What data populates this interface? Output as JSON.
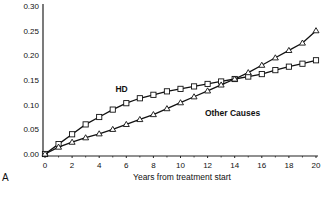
{
  "chart_data": {
    "type": "line",
    "title": "",
    "panel_label": "A",
    "xlabel": "Years from treatment start",
    "ylabel": "",
    "xlim": [
      0,
      20
    ],
    "ylim": [
      0,
      0.3
    ],
    "x_ticks": [
      "0",
      "2",
      "4",
      "6",
      "8",
      "10",
      "12",
      "14",
      "16",
      "18",
      "20"
    ],
    "y_ticks": [
      "0.00",
      "0.05",
      "0.10",
      "0.15",
      "0.20",
      "0.25",
      "0.30"
    ],
    "grid": false,
    "legend": "inline annotations",
    "x": [
      0,
      1,
      2,
      3,
      4,
      5,
      6,
      7,
      8,
      9,
      10,
      11,
      12,
      13,
      14,
      15,
      16,
      17,
      18,
      19,
      20
    ],
    "series": [
      {
        "name": "HD",
        "marker": "square",
        "values": [
          0.0,
          0.02,
          0.04,
          0.06,
          0.075,
          0.09,
          0.103,
          0.113,
          0.12,
          0.127,
          0.132,
          0.137,
          0.142,
          0.147,
          0.152,
          0.157,
          0.162,
          0.17,
          0.177,
          0.183,
          0.19
        ]
      },
      {
        "name": "Other Causes",
        "marker": "triangle",
        "values": [
          0.0,
          0.014,
          0.024,
          0.033,
          0.041,
          0.05,
          0.06,
          0.07,
          0.08,
          0.092,
          0.104,
          0.116,
          0.128,
          0.14,
          0.152,
          0.165,
          0.18,
          0.195,
          0.21,
          0.225,
          0.25
        ]
      }
    ],
    "annotations": [
      {
        "text": "HD",
        "x": 5.2,
        "y": 0.125
      },
      {
        "text": "Other Causes",
        "x": 11.8,
        "y": 0.078
      }
    ]
  }
}
